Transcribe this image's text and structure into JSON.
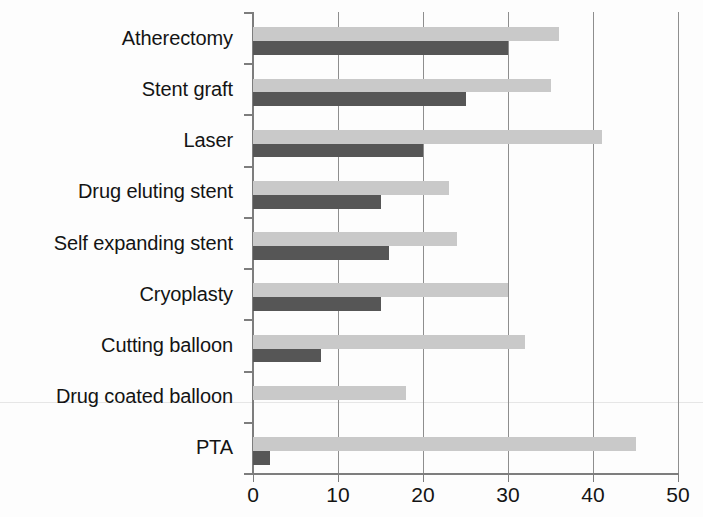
{
  "chart_data": {
    "type": "bar",
    "orientation": "horizontal",
    "title": "",
    "subtitle": "",
    "xlabel": "",
    "ylabel": "",
    "xlim": [
      0,
      50
    ],
    "xticks": [
      0,
      10,
      20,
      30,
      40,
      50
    ],
    "xtick_labels": [
      "0",
      "10",
      "20",
      "30",
      "40",
      "50"
    ],
    "grid": true,
    "grid_axis": "x",
    "legend": false,
    "legend_position": "none",
    "categories": [
      "Atherectomy",
      "Stent graft",
      "Laser",
      "Drug eluting stent",
      "Self expanding stent",
      "Cryoplasty",
      "Cutting balloon",
      "Drug coated balloon",
      "PTA"
    ],
    "series": [
      {
        "name": "light-series",
        "color": "#c9c9c9",
        "values": [
          36,
          35,
          41,
          23,
          24,
          30,
          32,
          18,
          45
        ]
      },
      {
        "name": "dark-series",
        "color": "#565656",
        "values": [
          30,
          25,
          20,
          15,
          16,
          15,
          8,
          0,
          2
        ]
      }
    ]
  },
  "colors": {
    "light_bar": "#c9c9c9",
    "dark_bar": "#565656",
    "axis": "#7d7d7d",
    "gridline": "#8e8e8e",
    "text": "#141414",
    "background": "#fdfdfd"
  }
}
